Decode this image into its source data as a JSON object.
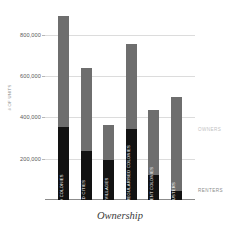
{
  "chart_data": {
    "type": "bar",
    "subtype": "stacked-vertical",
    "title": "",
    "xlabel": "Ownership",
    "ylabel": "# OF UNITS",
    "ylim": [
      0,
      900000
    ],
    "grid": true,
    "grid_axis": "y",
    "y_ticks": [
      200000,
      400000,
      600000,
      800000
    ],
    "y_tick_labels": [
      "200,000",
      "400,000",
      "600,000",
      "800,000"
    ],
    "legend_position": "right-inline",
    "categories": [
      "PLANNED COLONIES",
      "WALLED CITIES",
      "URBAN VILLAGES",
      "UNAUTHORIZED AND REGULARISED COLONIES",
      "RESETTLEMENT COLONIES",
      "JJ CLUSTERS"
    ],
    "series": [
      {
        "name": "RENTERS",
        "color": "#121212",
        "values": [
          355000,
          235000,
          195000,
          345000,
          120000,
          45000
        ]
      },
      {
        "name": "OWNERS",
        "color": "#6e6e6e",
        "values": [
          535000,
          405000,
          170000,
          410000,
          315000,
          455000
        ]
      }
    ],
    "totals": [
      890000,
      640000,
      365000,
      755000,
      435000,
      500000
    ]
  },
  "legend": {
    "owners_label": "OWNERS",
    "renters_label": "RENTERS"
  },
  "axes": {
    "y_title": "# OF UNITS",
    "x_title": "Ownership"
  },
  "colors": {
    "owners": "#6e6e6e",
    "renters": "#121212",
    "gridline": "#dcdcdc",
    "baseline": "#8c8c8c",
    "background": "#ffffff"
  }
}
